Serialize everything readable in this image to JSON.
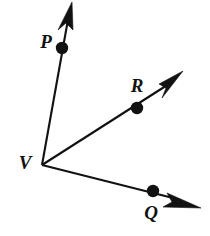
{
  "figure": {
    "type": "geometry-angle-diagram",
    "background_color": "#ffffff",
    "stroke_color": "#121212",
    "width": 210,
    "height": 236,
    "vertex": {
      "id": "V",
      "label": "V",
      "label_x": 25,
      "label_y": 165,
      "x": 42,
      "y": 165
    },
    "rays": [
      {
        "id": "ray-VP",
        "name": "ray-vp",
        "from": "V",
        "through": "P",
        "line": {
          "x1": 42,
          "y1": 165,
          "x2": 69,
          "y2": 14
        },
        "arrow_tip": {
          "x": 72,
          "y": 2
        },
        "arrow_polygon": "72,2 73,30 66,23 58,30"
      },
      {
        "id": "ray-VR",
        "name": "ray-vr",
        "from": "V",
        "through": "R",
        "line": {
          "x1": 42,
          "y1": 165,
          "x2": 172,
          "y2": 82
        },
        "arrow_tip": {
          "x": 183,
          "y": 71
        },
        "arrow_polygon": "183,71 159,84 166,88 162,98"
      },
      {
        "id": "ray-VQ",
        "name": "ray-vq",
        "from": "V",
        "through": "Q",
        "line": {
          "x1": 42,
          "y1": 165,
          "x2": 173,
          "y2": 198
        },
        "arrow_tip": {
          "x": 201,
          "y": 208
        },
        "arrow_polygon": "201,208 167,193 172,202 163,207"
      }
    ],
    "points": [
      {
        "id": "P",
        "label": "P",
        "x": 62,
        "y": 48,
        "r": 6.2,
        "label_x": 46,
        "label_y": 44
      },
      {
        "id": "R",
        "label": "R",
        "x": 137,
        "y": 108,
        "r": 6.2,
        "label_x": 137,
        "label_y": 88
      },
      {
        "id": "Q",
        "label": "Q",
        "x": 153,
        "y": 191,
        "r": 6.2,
        "label_x": 151,
        "label_y": 215
      }
    ]
  }
}
